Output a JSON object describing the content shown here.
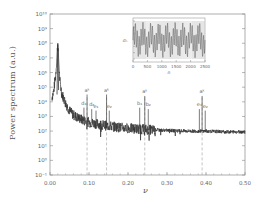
{
  "chart_data": {
    "type": "line",
    "title": "",
    "xlabel": "ν",
    "ylabel": "Power spectrum (a.u.)",
    "xlim": [
      0.0,
      0.5
    ],
    "ylim_log10": [
      -1,
      10
    ],
    "yscale": "log",
    "grid": false,
    "legend": null,
    "x_ticks": [
      "0.00",
      "0.10",
      "0.20",
      "0.30",
      "0.40",
      "0.50"
    ],
    "y_ticks": [
      "10^-1",
      "10^0",
      "10^1",
      "10^2",
      "10^3",
      "10^4",
      "10^5",
      "10^6",
      "10^7",
      "10^8",
      "10^9",
      "10^10"
    ],
    "baseline_description": "Spectrum decays from a dominant peak near ν≈0.02 (~10^8) toward a noisy floor near 10^2 by ν≈0.25, then flattens around 10^2 out to 0.50",
    "series": [
      {
        "name": "power spectrum",
        "x": [
          0.005,
          0.01,
          0.015,
          0.02,
          0.025,
          0.03,
          0.04,
          0.05,
          0.06,
          0.08,
          0.1,
          0.12,
          0.15,
          0.18,
          0.2,
          0.25,
          0.3,
          0.35,
          0.4,
          0.45,
          0.5
        ],
        "log10_y": [
          4.3,
          4.8,
          6.0,
          8.0,
          5.5,
          4.6,
          3.9,
          3.4,
          3.1,
          2.8,
          2.6,
          2.5,
          2.35,
          2.25,
          2.2,
          2.1,
          2.05,
          2.0,
          2.0,
          1.95,
          1.95
        ]
      }
    ],
    "peaks": [
      {
        "label": "d₁",
        "x": 0.087,
        "log10_y": 3.6
      },
      {
        "label": "a^k",
        "x": 0.095,
        "log10_y": 4.5
      },
      {
        "label": "d₂",
        "x": 0.107,
        "log10_y": 3.5
      },
      {
        "label": "e₁",
        "x": 0.118,
        "log10_y": 3.4
      },
      {
        "label": "a^k",
        "x": 0.145,
        "log10_y": 4.5
      },
      {
        "label": "e₂",
        "x": 0.152,
        "log10_y": 3.4
      },
      {
        "label": "b₁",
        "x": 0.23,
        "log10_y": 3.6
      },
      {
        "label": "a^k",
        "x": 0.243,
        "log10_y": 4.4
      },
      {
        "label": "b₂",
        "x": 0.252,
        "log10_y": 3.5
      },
      {
        "label": "a^k",
        "x": 0.39,
        "log10_y": 4.4
      },
      {
        "label": "e₁",
        "x": 0.383,
        "log10_y": 3.5
      },
      {
        "label": "e₂",
        "x": 0.398,
        "log10_y": 3.4
      }
    ],
    "dashed_vlines_x": [
      0.095,
      0.145,
      0.243,
      0.39
    ],
    "inset": {
      "type": "line",
      "xlabel": "n",
      "ylabel": "σₙ",
      "x_ticks": [
        "0",
        "500",
        "1000",
        "1500",
        "2000",
        "2500"
      ],
      "xlim": [
        0,
        2500
      ],
      "description": "dense quasi-periodic oscillation filling the frame"
    }
  },
  "labels": {
    "ylabel": "Power spectrum (a.u.)",
    "xlabel": "ν"
  }
}
